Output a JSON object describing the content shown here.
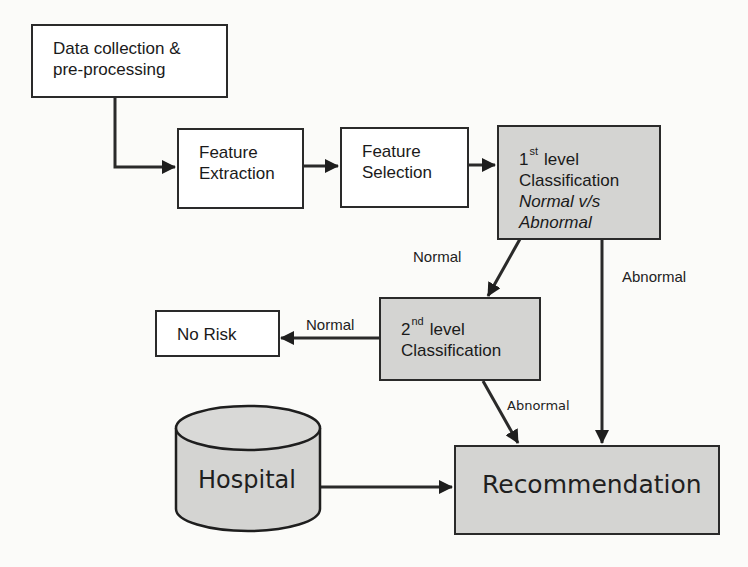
{
  "diagram": {
    "nodes": {
      "data_collection": {
        "line1": "Data collection &",
        "line2": "pre-processing"
      },
      "feature_extraction": {
        "line1": "Feature",
        "line2": "Extraction"
      },
      "feature_selection": {
        "line1": "Feature",
        "line2": "Selection"
      },
      "first_level": {
        "num": "1",
        "sup": "st",
        "word": "level",
        "line2": "Classification",
        "line3": "Normal v/s",
        "line4": "Abnormal"
      },
      "second_level": {
        "num": "2",
        "sup": "nd",
        "word": "level",
        "line2": "Classification"
      },
      "no_risk": {
        "label": "No Risk"
      },
      "hospital": {
        "label": "Hospital"
      },
      "recommendation": {
        "label": "Recommendation"
      }
    },
    "edge_labels": {
      "first_to_second": "Normal",
      "first_to_recommendation": "Abnormal",
      "second_to_norisk": "Normal",
      "second_to_recommendation": "Abnormal"
    },
    "colors": {
      "shaded_fill": "#d4d4d2",
      "line": "#2a2a2a",
      "background": "#fbfbf9"
    }
  }
}
